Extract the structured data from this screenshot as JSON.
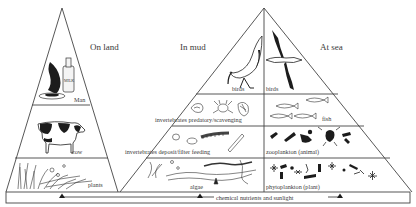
{
  "diagram": {
    "type": "food pyramids",
    "headings": {
      "land": "On land",
      "mud": "In mud",
      "sea": "At sea"
    },
    "land_pyramid": {
      "levels": [
        {
          "label": "Man",
          "icon": "milk-bottle-and-food-icon"
        },
        {
          "label": "cow",
          "icon": "cow-icon"
        },
        {
          "label": "plants",
          "icon": "grass-plants-icon"
        }
      ]
    },
    "mud_side": {
      "levels": [
        {
          "label": "birds",
          "icon": "wading-bird-icon"
        },
        {
          "label": "invertebrates predatory/scavenging",
          "icon": "crab-shell-icon"
        },
        {
          "label": "invertebrates deposit/filter feeding",
          "icon": "worm-clam-icon"
        },
        {
          "label": "algae",
          "icon": "seaweed-algae-icon"
        }
      ]
    },
    "sea_side": {
      "levels": [
        {
          "label": "birds",
          "icon": "seabird-icon"
        },
        {
          "label": "fish",
          "icon": "fish-icon"
        },
        {
          "label": "zooplankton (animal)",
          "icon": "zooplankton-icon"
        },
        {
          "label": "phytoplankton (plant)",
          "icon": "phytoplankton-icon"
        }
      ]
    },
    "base": {
      "label": "chemical nutrients and sunlight"
    }
  }
}
